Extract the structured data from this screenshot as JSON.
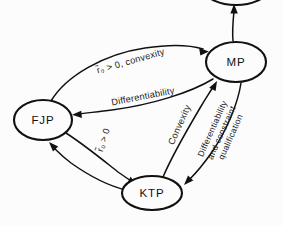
{
  "diagram": {
    "type": "flow-diagram",
    "background_color": "#fcfcfd",
    "ink_color": "#111111",
    "nodes": [
      {
        "id": "FJP",
        "label": "FJP",
        "cx": 43,
        "cy": 120,
        "rx": 29,
        "ry": 20
      },
      {
        "id": "MP",
        "label": "MP",
        "cx": 236,
        "cy": 62,
        "rx": 30,
        "ry": 20
      },
      {
        "id": "KTP",
        "label": "KTP",
        "cx": 152,
        "cy": 193,
        "rx": 30,
        "ry": 17
      },
      {
        "id": "TOP",
        "label": "",
        "cx": 236,
        "cy": -9,
        "rx": 30,
        "ry": 14
      }
    ],
    "edges": [
      {
        "id": "fjp-to-mp",
        "from": "FJP",
        "to": "MP",
        "label": "r̃₀ > 0, convexity",
        "label_parts": {
          "symbol": "r",
          "accent": "tilde",
          "subscript": "0",
          "relation": "> 0",
          "condition": "convexity"
        },
        "label_x": 131,
        "label_y": 62,
        "label_rotation": -16
      },
      {
        "id": "mp-to-fjp",
        "from": "MP",
        "to": "FJP",
        "label": "Differentiability",
        "label_x": 143,
        "label_y": 97,
        "label_rotation": -11
      },
      {
        "id": "fjp-to-ktp",
        "from": "FJP",
        "to": "KTP",
        "label": "r̃₀ > 0",
        "label_parts": {
          "symbol": "r",
          "accent": "tilde",
          "subscript": "0",
          "relation": "> 0"
        },
        "label_x": 104,
        "label_y": 140,
        "label_rotation": -72
      },
      {
        "id": "ktp-to-fjp",
        "from": "KTP",
        "to": "FJP",
        "label": "",
        "label_x": 0,
        "label_y": 0,
        "label_rotation": 0
      },
      {
        "id": "ktp-to-mp",
        "from": "KTP",
        "to": "MP",
        "label": "Convexity",
        "label_x": 180,
        "label_y": 125,
        "label_rotation": -66
      },
      {
        "id": "mp-to-ktp",
        "from": "MP",
        "to": "KTP",
        "label": "Differentiability and constraint qualification",
        "label_lines": [
          "Differentiability",
          "and constraint",
          "qualification"
        ],
        "label_x": 222,
        "label_y": 133,
        "label_rotation": -66
      },
      {
        "id": "mp-to-top",
        "from": "MP",
        "to": "TOP",
        "label": "",
        "label_x": 0,
        "label_y": 0,
        "label_rotation": 0
      }
    ]
  }
}
